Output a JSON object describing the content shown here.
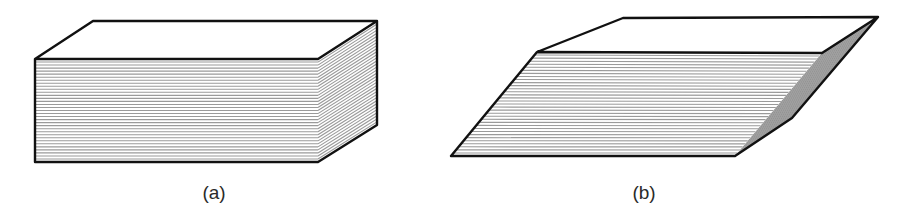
{
  "figure": {
    "panels": [
      {
        "id": "a",
        "caption": "(a)",
        "description": "Rectangular stack of thin sheets (undeformed block)",
        "sheet_line_count": 34,
        "vertices": {
          "front_top_left": [
            35,
            59
          ],
          "front_top_right": [
            318,
            59
          ],
          "front_bottom_left": [
            35,
            162
          ],
          "front_bottom_right": [
            318,
            162
          ],
          "back_top_left": [
            93,
            21
          ],
          "back_top_right": [
            377,
            21
          ],
          "back_bottom_right": [
            377,
            125
          ]
        }
      },
      {
        "id": "b",
        "caption": "(b)",
        "description": "Same stack of sheets sheared into a parallelepiped",
        "sheet_line_count": 34,
        "vertices": {
          "front_top_left": [
            537,
            52
          ],
          "front_top_right": [
            822,
            53
          ],
          "front_bottom_left": [
            451,
            156
          ],
          "front_bottom_right": [
            735,
            156
          ],
          "back_top_left": [
            623,
            18
          ],
          "back_top_right": [
            878,
            17
          ],
          "back_bottom_right": [
            792,
            118
          ]
        }
      }
    ],
    "colors": {
      "outline": "#111111",
      "sheet_line": "#9a9a9a",
      "side_fill_b": "#b5b5b5",
      "background": "#ffffff"
    }
  }
}
